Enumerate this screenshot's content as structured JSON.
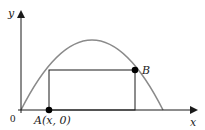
{
  "diagram": {
    "type": "parabola-inscribed-rectangle",
    "axes": {
      "x_label": "x",
      "y_label": "y",
      "origin_label": "0"
    },
    "points": {
      "A": {
        "label": "A(x, 0)"
      },
      "B": {
        "label": "B"
      }
    },
    "colors": {
      "curve": "#8a8a8a",
      "axes": "#1a1a1a",
      "rectangle": "#1a1a1a",
      "points": "#000000"
    }
  }
}
